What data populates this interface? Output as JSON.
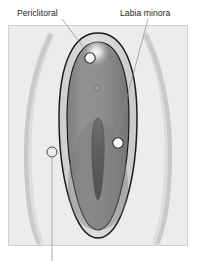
{
  "figure": {
    "kind": "anatomical-diagram",
    "background_color": "#ffffff",
    "panel": {
      "fill": "#ececed",
      "border_color": "#cfcfd1",
      "x": 8,
      "y": 25,
      "width": 180,
      "height": 221
    }
  },
  "labels": [
    {
      "id": "periclitoral",
      "text": "Periclitoral",
      "x": 17,
      "y": 16,
      "anchor": "start",
      "leader_path": "M 62 19 L 93 60",
      "marker": {
        "x": 90,
        "y": 58,
        "r": 5.2,
        "style": "filled"
      }
    },
    {
      "id": "labia-minora",
      "text": "Labia minora",
      "x": 120,
      "y": 16,
      "anchor": "start",
      "leader_path": "M 148 19 L 115 142",
      "marker": {
        "x": 118,
        "y": 143,
        "r": 5.2,
        "style": "filled"
      }
    },
    {
      "id": "unlabeled-lower",
      "text": "",
      "x": 52,
      "y": 258,
      "anchor": "middle",
      "leader_path": "M 52 158 L 52 261",
      "marker": {
        "x": 52,
        "y": 152,
        "r": 5.0,
        "style": "open"
      }
    }
  ],
  "anatomy": {
    "outer_labia_arc_color": "#bcbcbe",
    "vestibule_band_color": "#d7d7d8",
    "inner_field_color": "#8e8e90",
    "inner_shadow_color": "#6e6e70",
    "slit_color": "#5d5d5f",
    "outline_color": "#1b1b1b",
    "highlight_color": "#ffffff"
  },
  "colors": {
    "panel_fill": "#ececed",
    "panel_border": "#cfcfd1",
    "label_text": "#231f20",
    "leader_line": "#8c8c8c",
    "marker_fill": "#fdfdfd",
    "marker_stroke": "#2b2b2b"
  }
}
